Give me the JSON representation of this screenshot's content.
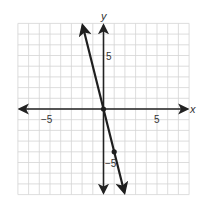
{
  "chart_data": {
    "type": "line",
    "title": "",
    "xlabel": "x",
    "ylabel": "y",
    "xlim": [
      -8,
      8
    ],
    "ylim": [
      -8,
      8
    ],
    "grid": true,
    "grid_step": 1,
    "x_ticks_labeled": [
      {
        "value": -5,
        "label": "−5"
      },
      {
        "value": 5,
        "label": "5"
      }
    ],
    "y_ticks_labeled": [
      {
        "value": 5,
        "label": "5"
      },
      {
        "value": -5,
        "label": "−5"
      }
    ],
    "series": [
      {
        "name": "y = -4x",
        "equation": "y = -4x",
        "slope": -4,
        "intercept": 0,
        "arrows_both_ends": true,
        "x": [
          -1.95,
          1.95
        ],
        "y": [
          7.8,
          -7.8
        ],
        "marked_points": [
          {
            "x": 0,
            "y": 0
          },
          {
            "x": 1,
            "y": -4
          }
        ]
      }
    ],
    "legend": null,
    "colors": {
      "line": "#1e1e1e",
      "axes": "#222222",
      "grid": "#d4d4d4"
    }
  },
  "labels": {
    "x_axis": "x",
    "y_axis": "y",
    "x_neg5": "−5",
    "x_pos5": "5",
    "y_pos5": "5",
    "y_neg5": "−5"
  }
}
